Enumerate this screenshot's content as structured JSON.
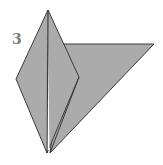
{
  "diagram": {
    "step_number": "3",
    "colors": {
      "paper_fill": "#ababab",
      "edge_stroke": "#3a3a3a",
      "label": "#7a7a7a",
      "background": "#ffffff"
    },
    "shapes": {
      "back_triangle": "64,44 154,44 50,153",
      "kite": "48,10 16,79 47,153 79,77",
      "center_crease": "48,10 48,153",
      "gap_line": "50,153 79,77"
    }
  }
}
